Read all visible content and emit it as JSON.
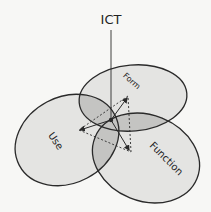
{
  "diagram": {
    "title": "ICT",
    "circles": [
      {
        "id": "form",
        "label": "Form"
      },
      {
        "id": "use",
        "label": "Use"
      },
      {
        "id": "function",
        "label": "Function"
      }
    ],
    "colors": {
      "background": "#f7f7f5",
      "circle_fill": "#e4e4e2",
      "overlap_fill": "#c2c2c0",
      "stroke": "#2a2a2a"
    },
    "connections": {
      "solid_arrows": [
        "center→Form",
        "center→Use",
        "center→Function"
      ],
      "dotted_triangle": [
        "Form–Use",
        "Use–Function",
        "Function–Form"
      ]
    }
  }
}
